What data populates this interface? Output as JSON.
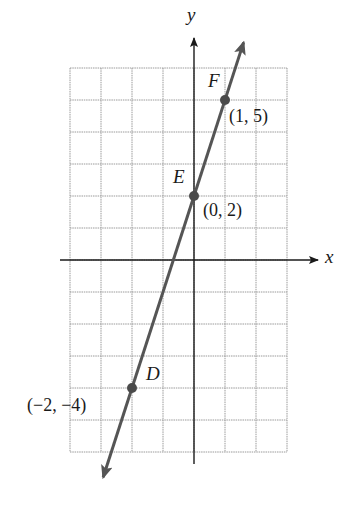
{
  "chart_data": {
    "type": "line",
    "title": "",
    "xlabel": "x",
    "ylabel": "y",
    "xlim": [
      -4,
      3
    ],
    "ylim": [
      -6,
      6
    ],
    "grid": true,
    "series": [
      {
        "name": "line through D, E, F",
        "equation": "y = 3x + 2",
        "x": [
          -2,
          0,
          1
        ],
        "y": [
          -4,
          2,
          5
        ]
      }
    ],
    "points": [
      {
        "label": "D",
        "coord_label": "(−2, −4)",
        "x": -2,
        "y": -4
      },
      {
        "label": "E",
        "coord_label": "(0, 2)",
        "x": 0,
        "y": 2
      },
      {
        "label": "F",
        "coord_label": "(1, 5)",
        "x": 1,
        "y": 5
      }
    ],
    "colors": {
      "line": "#555555",
      "grid": "#9a9a9a",
      "axis": "#1a1a1a"
    }
  },
  "axes": {
    "x_label": "x",
    "y_label": "y"
  }
}
